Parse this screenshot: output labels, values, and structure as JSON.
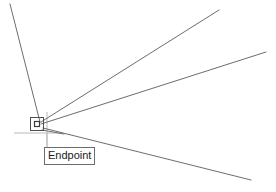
{
  "viewport": {
    "name": "cad-drawing-viewport",
    "background_color": "#ffffff",
    "width": 276,
    "height": 192
  },
  "snap": {
    "tooltip_label": "Endpoint",
    "marker_type": "square",
    "marker_color": "#4f4f4f",
    "tooltip_border_color": "#6b6b6b",
    "tooltip_text_color": "#1a1a1a",
    "vertex_x": 38,
    "vertex_y": 124
  },
  "crosshair": {
    "color": "#b9b9b9",
    "vertical_x": 47,
    "vertical_top": 112,
    "vertical_bottom": 160,
    "horizontal_y": 133,
    "horizontal_left": 14,
    "horizontal_right": 62
  },
  "geometry": {
    "line_color": "#6d6d70",
    "lines": [
      {
        "name": "ray-upper-left",
        "x1": 10,
        "y1": 4,
        "x2": 40,
        "y2": 122
      },
      {
        "name": "ray-upper-right",
        "x1": 41,
        "y1": 122,
        "x2": 219,
        "y2": 10
      },
      {
        "name": "ray-middle-right",
        "x1": 41,
        "y1": 124,
        "x2": 266,
        "y2": 52
      },
      {
        "name": "ray-lower-right",
        "x1": 43,
        "y1": 128,
        "x2": 251,
        "y2": 180
      },
      {
        "name": "segment-short-lower",
        "x1": 42,
        "y1": 130,
        "x2": 64,
        "y2": 134
      }
    ]
  },
  "cursor": {
    "name": "aperture-box",
    "x": 30,
    "y": 117,
    "size": 14,
    "color": "#4f4f4f"
  }
}
